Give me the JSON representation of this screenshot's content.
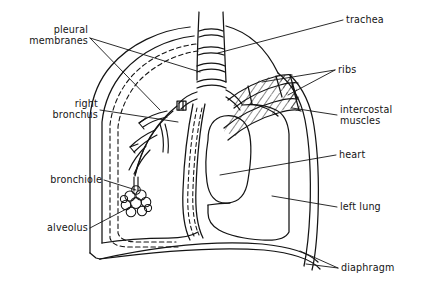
{
  "figure": {
    "kind": "anatomical-line-diagram",
    "line_color": "#141414",
    "background_color": "#ffffff",
    "text_color": "#141414"
  },
  "labels": {
    "pleural_membranes_line1": "pleural",
    "pleural_membranes_line2": "membranes",
    "right_bronchus_line1": "right",
    "right_bronchus_line2": "bronchus",
    "bronchiole": "bronchiole",
    "alveolus": "alveolus",
    "trachea": "trachea",
    "ribs": "ribs",
    "intercostal_muscles_line1": "intercostal",
    "intercostal_muscles_line2": "muscles",
    "heart": "heart",
    "left_lung": "left  lung",
    "diaphragm": "diaphragm"
  },
  "structures": [
    {
      "name": "trachea",
      "side": "center-top",
      "label": "trachea"
    },
    {
      "name": "pleural-membranes",
      "side": "left",
      "label": "pleural membranes"
    },
    {
      "name": "right-bronchus",
      "side": "left",
      "label": "right bronchus"
    },
    {
      "name": "bronchiole",
      "side": "left",
      "label": "bronchiole"
    },
    {
      "name": "alveolus",
      "side": "left",
      "label": "alveolus"
    },
    {
      "name": "ribs",
      "side": "right",
      "label": "ribs"
    },
    {
      "name": "intercostal-muscles",
      "side": "right",
      "label": "intercostal muscles"
    },
    {
      "name": "heart",
      "side": "right",
      "label": "heart"
    },
    {
      "name": "left-lung",
      "side": "right",
      "label": "left lung"
    },
    {
      "name": "diaphragm",
      "side": "right",
      "label": "diaphragm"
    }
  ]
}
